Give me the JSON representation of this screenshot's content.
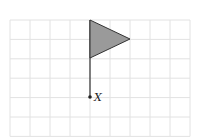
{
  "diagram": {
    "type": "grid-figure",
    "grid": {
      "x_start": 10,
      "y_start": 20,
      "cols": 9,
      "rows": 6,
      "cell_w": 20,
      "cell_h": 19.4,
      "line_color": "#e2e2e2"
    },
    "flag": {
      "pole": {
        "x": 90,
        "y_top": 20,
        "y_bottom": 97
      },
      "triangle": [
        [
          90,
          20
        ],
        [
          130,
          39
        ],
        [
          90,
          58
        ]
      ],
      "fill_color": "#9a9a9a",
      "stroke_color": "#333333"
    },
    "point": {
      "x": 90,
      "y": 97,
      "label": "X",
      "color": "#222222"
    }
  }
}
